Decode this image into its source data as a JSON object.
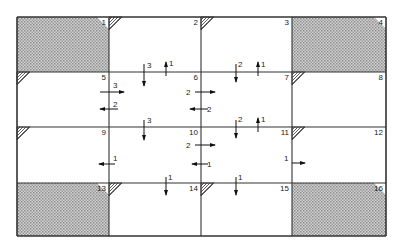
{
  "diagram": {
    "grid": {
      "x": [
        17,
        109,
        201,
        292,
        386
      ],
      "y": [
        17,
        72,
        127,
        183,
        236
      ],
      "line_color": "#333333",
      "shade_color": "#b8b8b8"
    },
    "cells": [
      {
        "id": "1",
        "row": 0,
        "col": 0,
        "shaded": true,
        "chamfer": "tr"
      },
      {
        "id": "2",
        "row": 0,
        "col": 1,
        "shaded": false,
        "hatch": "tl"
      },
      {
        "id": "3",
        "row": 0,
        "col": 2,
        "shaded": false,
        "hatch": "tl"
      },
      {
        "id": "4",
        "row": 0,
        "col": 3,
        "shaded": true,
        "chamfer": "tr"
      },
      {
        "id": "5",
        "row": 1,
        "col": 0,
        "shaded": false,
        "hatch": "tl"
      },
      {
        "id": "6",
        "row": 1,
        "col": 1,
        "shaded": false
      },
      {
        "id": "7",
        "row": 1,
        "col": 2,
        "shaded": false
      },
      {
        "id": "8",
        "row": 1,
        "col": 3,
        "shaded": false,
        "hatch": "tl"
      },
      {
        "id": "9",
        "row": 2,
        "col": 0,
        "shaded": false,
        "hatch": "tl"
      },
      {
        "id": "10",
        "row": 2,
        "col": 1,
        "shaded": false
      },
      {
        "id": "11",
        "row": 2,
        "col": 2,
        "shaded": false
      },
      {
        "id": "12",
        "row": 2,
        "col": 3,
        "shaded": false,
        "hatch": "tl"
      },
      {
        "id": "13",
        "row": 3,
        "col": 0,
        "shaded": true,
        "chamfer": "tr"
      },
      {
        "id": "14",
        "row": 3,
        "col": 1,
        "shaded": false,
        "hatch": "tl"
      },
      {
        "id": "15",
        "row": 3,
        "col": 2,
        "shaded": false,
        "hatch": "tl"
      },
      {
        "id": "16",
        "row": 3,
        "col": 3,
        "shaded": true,
        "chamfer": "tr"
      }
    ],
    "arrows": [
      {
        "dir": "down",
        "x": 144,
        "y1": 64,
        "y2": 86,
        "label": "3",
        "lx": 147,
        "ly": 68
      },
      {
        "dir": "up",
        "x": 166,
        "y1": 76,
        "y2": 62,
        "label": "1",
        "lx": 169,
        "ly": 66
      },
      {
        "dir": "down",
        "x": 236,
        "y1": 64,
        "y2": 82,
        "label": "2",
        "lx": 238,
        "ly": 67
      },
      {
        "dir": "up",
        "x": 258,
        "y1": 76,
        "y2": 62,
        "label": "1",
        "lx": 261,
        "ly": 67
      },
      {
        "dir": "right",
        "y": 92,
        "x1": 100,
        "x2": 124,
        "label": "3",
        "lx": 113,
        "ly": 88
      },
      {
        "dir": "left",
        "y": 109,
        "x1": 118,
        "x2": 100,
        "label": "2",
        "lx": 113,
        "ly": 107
      },
      {
        "dir": "right",
        "y": 92,
        "x1": 195,
        "x2": 215,
        "label": "2",
        "lx": 186,
        "ly": 95
      },
      {
        "dir": "left",
        "y": 109,
        "x1": 208,
        "x2": 190,
        "label": "2",
        "lx": 207,
        "ly": 112
      },
      {
        "dir": "down",
        "x": 144,
        "y1": 120,
        "y2": 140,
        "label": "3",
        "lx": 147,
        "ly": 123
      },
      {
        "dir": "down",
        "x": 236,
        "y1": 120,
        "y2": 138,
        "label": "2",
        "lx": 238,
        "ly": 122
      },
      {
        "dir": "up",
        "x": 258,
        "y1": 132,
        "y2": 118,
        "label": "1",
        "lx": 261,
        "ly": 122
      },
      {
        "dir": "right",
        "y": 145,
        "x1": 195,
        "x2": 215,
        "label": "2",
        "lx": 186,
        "ly": 148
      },
      {
        "dir": "left",
        "y": 164,
        "x1": 115,
        "x2": 99,
        "label": "1",
        "lx": 113,
        "ly": 161
      },
      {
        "dir": "left",
        "y": 164,
        "x1": 208,
        "x2": 192,
        "label": "1",
        "lx": 207,
        "ly": 167
      },
      {
        "dir": "right",
        "y": 163,
        "x1": 292,
        "x2": 305,
        "label": "1",
        "lx": 284,
        "ly": 161
      },
      {
        "dir": "down",
        "x": 166,
        "y1": 177,
        "y2": 195,
        "label": "1",
        "lx": 168,
        "ly": 180
      },
      {
        "dir": "down",
        "x": 236,
        "y1": 177,
        "y2": 195,
        "label": "1",
        "lx": 238,
        "ly": 180
      }
    ]
  }
}
